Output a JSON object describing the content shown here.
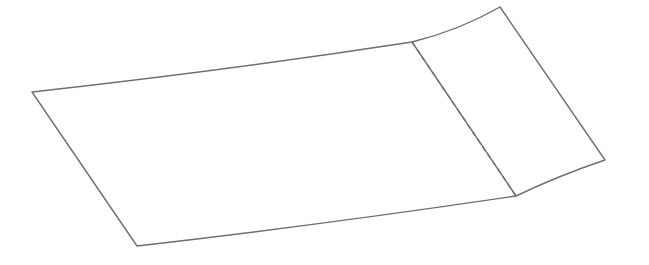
{
  "diagram": {
    "stroke_color": "#6e6e6e",
    "background": "#ffffff",
    "stroke_width": 1.4,
    "dash_pattern": "5,4",
    "main_panel": {
      "path": "M32,92 Q230,70 412,42 L516,196 Q320,225 137,246 Z"
    },
    "flap_panel": {
      "path": "M412,42 Q460,30 500,7 L605,160 Q560,175 516,196"
    },
    "fold_line": {
      "x1": 412,
      "y1": 42,
      "x2": 516,
      "y2": 196
    }
  }
}
